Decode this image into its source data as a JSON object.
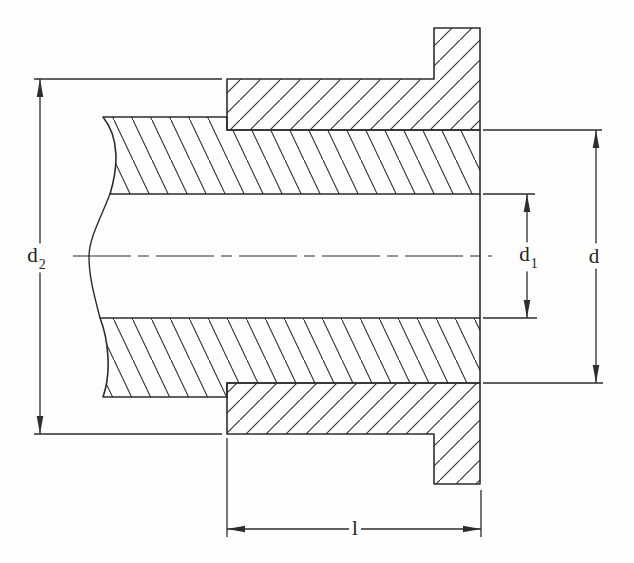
{
  "figure": {
    "kind": "flanged-bushing-cross-section",
    "colors": {
      "ink": "#2d2d2d",
      "paper": "#fdfdfb"
    },
    "dimensions": {
      "d2": {
        "base": "d",
        "sub": "2"
      },
      "d1": {
        "base": "d",
        "sub": "1"
      },
      "d": {
        "base": "d"
      },
      "l": {
        "base": "l"
      }
    }
  }
}
